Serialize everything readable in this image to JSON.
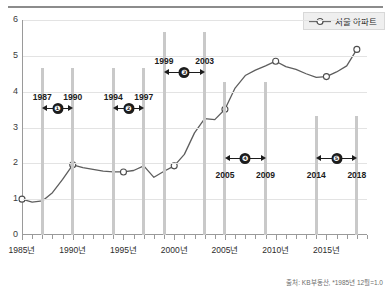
{
  "legend": {
    "label": "서울 아파트",
    "marker": "circle-open-line-icon"
  },
  "source": {
    "text": "출처: KB부동산, *1985년 12월=1.0"
  },
  "axes": {
    "y_ticks": [
      "0",
      "1",
      "2",
      "3",
      "4",
      "5",
      "6"
    ],
    "x_ticks": [
      "1985년",
      "1990년",
      "1995년",
      "2000년",
      "2005년",
      "2010년",
      "2015년"
    ]
  },
  "annotations": [
    {
      "badge": "❶",
      "start_year": "1987",
      "end_year": "1990"
    },
    {
      "badge": "❷",
      "start_year": "1994",
      "end_year": "1997"
    },
    {
      "badge": "❸",
      "start_year": "1999",
      "end_year": "2003"
    },
    {
      "badge": "❹",
      "start_year": "2005",
      "end_year": "2009"
    },
    {
      "badge": "❺",
      "start_year": "2014",
      "end_year": "2018"
    }
  ],
  "chart_data": {
    "type": "line",
    "title": "",
    "xlabel": "",
    "ylabel": "",
    "xlim": [
      1985,
      2019
    ],
    "ylim": [
      0,
      6
    ],
    "grid": true,
    "legend_position": "top-right",
    "series": [
      {
        "name": "서울 아파트",
        "marker_years": [
          1985,
          1990,
          1995,
          2000,
          2005,
          2010,
          2015,
          2018
        ],
        "x": [
          1985,
          1986,
          1987,
          1988,
          1989,
          1990,
          1991,
          1992,
          1993,
          1994,
          1995,
          1996,
          1997,
          1998,
          1999,
          2000,
          2001,
          2002,
          2003,
          2004,
          2005,
          2006,
          2007,
          2008,
          2009,
          2010,
          2011,
          2012,
          2013,
          2014,
          2015,
          2016,
          2017,
          2018
        ],
        "values": [
          1.0,
          0.92,
          0.95,
          1.18,
          1.55,
          1.96,
          1.88,
          1.83,
          1.78,
          1.76,
          1.76,
          1.8,
          1.93,
          1.61,
          1.78,
          1.93,
          2.25,
          2.85,
          3.25,
          3.22,
          3.51,
          4.1,
          4.45,
          4.6,
          4.72,
          4.85,
          4.7,
          4.62,
          4.5,
          4.4,
          4.42,
          4.55,
          4.72,
          5.18
        ]
      }
    ],
    "annotation_spans": [
      {
        "label": "❶",
        "from": 1987,
        "to": 1990
      },
      {
        "label": "❷",
        "from": 1994,
        "to": 1997
      },
      {
        "label": "❸",
        "from": 1999,
        "to": 2003
      },
      {
        "label": "❹",
        "from": 2005,
        "to": 2009
      },
      {
        "label": "❺",
        "from": 2014,
        "to": 2018
      }
    ]
  }
}
